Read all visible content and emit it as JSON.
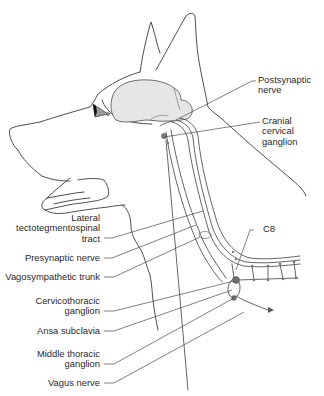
{
  "diagram": {
    "colors": {
      "outline": "#3a3a3a",
      "brain_fill": "#e6e6e6",
      "nerve": "#555555",
      "ganglion": "#666666",
      "leader": "#4a4a4a",
      "text": "#2a2a2a"
    },
    "labels_right": {
      "postsynaptic_nerve": [
        "Postsynaptic",
        "nerve"
      ],
      "cranial_cervical_ganglion": [
        "Cranial",
        "cervical",
        "ganglion"
      ],
      "c8": "C8"
    },
    "labels_left": {
      "lateral_tract": [
        "Lateral",
        "tectotegmentospinal",
        "tract"
      ],
      "presynaptic_nerve": "Presynaptic nerve",
      "vagosympathetic_trunk": "Vagosympathetic trunk",
      "cervicothoracic_ganglion": [
        "Cervicothoracic",
        "ganglion"
      ],
      "ansa_subclavia": "Ansa subclavia",
      "middle_thoracic_ganglion": [
        "Middle thoracic",
        "ganglion"
      ],
      "vagus_nerve": "Vagus nerve"
    }
  }
}
